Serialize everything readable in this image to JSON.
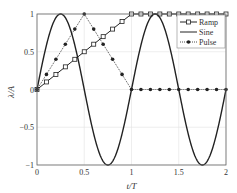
{
  "chart_data": {
    "type": "line",
    "title": "",
    "xlabel": "t/T",
    "ylabel": "λ/A",
    "xlim": [
      0,
      2
    ],
    "ylim": [
      -1,
      1
    ],
    "xticks": [
      0,
      0.5,
      1,
      1.5,
      2
    ],
    "xtick_labels": [
      "0",
      "0.5",
      "1",
      "1.5",
      "2"
    ],
    "yticks": [
      -1,
      -0.5,
      0,
      0.5,
      1
    ],
    "ytick_labels": [
      "−1",
      "−0.5",
      "0",
      "0.5",
      "1"
    ],
    "grid": true,
    "legend_position": "upper right",
    "series": [
      {
        "name": "Ramp",
        "style": "solid",
        "marker": "square",
        "x": [
          0,
          0.1,
          0.2,
          0.3,
          0.4,
          0.5,
          0.6,
          0.7,
          0.8,
          0.9,
          1.0,
          1.1,
          1.2,
          1.3,
          1.4,
          1.5,
          1.6,
          1.7,
          1.8,
          1.9,
          2.0
        ],
        "values": [
          0,
          0.1,
          0.2,
          0.3,
          0.4,
          0.5,
          0.6,
          0.7,
          0.8,
          0.9,
          1.0,
          1,
          1,
          1,
          1,
          1,
          1,
          1,
          1,
          1,
          1
        ]
      },
      {
        "name": "Sine",
        "style": "solid",
        "marker": "none",
        "function": "sin(2*pi*t)",
        "x": [
          0,
          0.25,
          0.5,
          0.75,
          1.0,
          1.25,
          1.5,
          1.75,
          2.0
        ],
        "values": [
          0,
          1,
          0,
          -1,
          0,
          1,
          0,
          -1,
          0
        ]
      },
      {
        "name": "Pulse",
        "style": "dotted",
        "marker": "circle",
        "x": [
          0,
          0.1,
          0.2,
          0.3,
          0.4,
          0.5,
          0.6,
          0.7,
          0.8,
          0.9,
          1.0,
          1.1,
          1.2,
          1.3,
          1.4,
          1.5,
          1.6,
          1.7,
          1.8,
          1.9,
          2.0
        ],
        "values": [
          0,
          0.2,
          0.4,
          0.6,
          0.8,
          1.0,
          0.8,
          0.6,
          0.4,
          0.2,
          0,
          0,
          0,
          0,
          0,
          0,
          0,
          0,
          0,
          0,
          0
        ]
      }
    ]
  },
  "legend": {
    "items": [
      {
        "label": "Ramp"
      },
      {
        "label": "Sine"
      },
      {
        "label": "Pulse"
      }
    ]
  },
  "colors": {
    "line": "#222222",
    "grid": "#e3e3e3",
    "axis": "#555555"
  }
}
